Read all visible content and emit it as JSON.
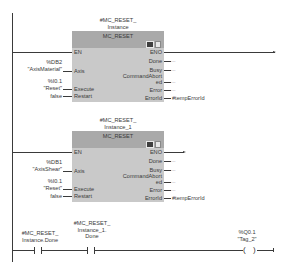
{
  "networks": [
    {
      "instance": [
        "#MC_RESET_",
        "Instance"
      ],
      "block_type": "MC_RESET",
      "inputs": [
        {
          "pin": "EN",
          "operand": []
        },
        {
          "pin": "Axis",
          "operand": [
            "%DB2",
            "\"AxisMaterial\""
          ]
        },
        {
          "pin": "Execute",
          "operand": [
            "%I0.1",
            "\"Reset\""
          ]
        },
        {
          "pin": "Restart",
          "operand": [
            "false"
          ]
        }
      ],
      "outputs": [
        {
          "pin": "ENO",
          "operand": ""
        },
        {
          "pin": "Done",
          "operand": "..."
        },
        {
          "pin": "Busy",
          "operand": "..."
        },
        {
          "pin": "CommandAbort",
          "pin2": "ed",
          "operand": "..."
        },
        {
          "pin": "Error",
          "operand": "..."
        },
        {
          "pin": "ErrorId",
          "operand": "#tempErrorId"
        }
      ]
    },
    {
      "instance": [
        "#MC_RESET_",
        "Instance_1"
      ],
      "block_type": "MC_RESET",
      "inputs": [
        {
          "pin": "EN",
          "operand": []
        },
        {
          "pin": "Axis",
          "operand": [
            "%DB1",
            "\"AxisShear\""
          ]
        },
        {
          "pin": "Execute",
          "operand": [
            "%I0.1",
            "\"Reset\""
          ]
        },
        {
          "pin": "Restart",
          "operand": [
            "false"
          ]
        }
      ],
      "outputs": [
        {
          "pin": "ENO",
          "operand": ""
        },
        {
          "pin": "Done",
          "operand": "..."
        },
        {
          "pin": "Busy",
          "operand": "..."
        },
        {
          "pin": "CommandAbort",
          "pin2": "ed",
          "operand": "..."
        },
        {
          "pin": "Error",
          "operand": "..."
        },
        {
          "pin": "ErrorId",
          "operand": "#tempErrorId"
        }
      ]
    }
  ],
  "rung3": {
    "contact1": [
      "#MC_RESET_",
      "Instance.Done"
    ],
    "contact2": [
      "#MC_RESET_",
      "Instance_1.",
      "Done"
    ],
    "coil": [
      "%Q0.1",
      "\"Tag_2\""
    ]
  }
}
